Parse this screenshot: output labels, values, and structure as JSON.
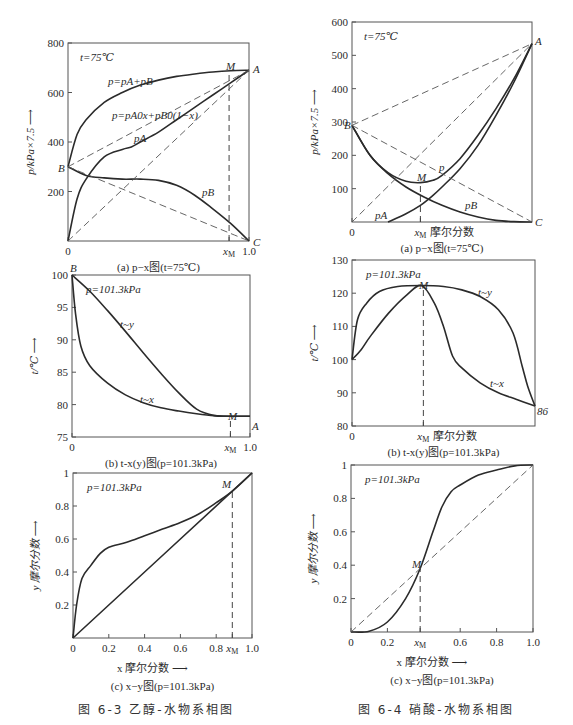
{
  "figures": [
    {
      "id": "6-3",
      "caption": "图 6-3    乙醇-水物系相图"
    },
    {
      "id": "6-4",
      "caption": "图 6-4    硝酸-水物系相图"
    }
  ],
  "chart_data": [
    {
      "id": "6-3a",
      "type": "line",
      "title": "(a) p−x图(t=75℃)",
      "annotation": "t=75℃",
      "xlabel": "",
      "ylabel": "p/kPa×7.5",
      "xlim": [
        0,
        1
      ],
      "ylim": [
        0,
        800
      ],
      "xticks": [
        "0",
        "xM",
        "1.0"
      ],
      "yticks": [
        200,
        400,
        600,
        800
      ],
      "point_labels": [
        "A",
        "B",
        "C",
        "M"
      ],
      "series": [
        {
          "name": "p=pA+pB",
          "x": [
            0,
            0.05,
            0.1,
            0.2,
            0.3,
            0.4,
            0.5,
            0.6,
            0.7,
            0.8,
            0.9,
            1.0
          ],
          "y": [
            300,
            430,
            490,
            560,
            600,
            630,
            650,
            665,
            675,
            683,
            688,
            690
          ]
        },
        {
          "name": "pA",
          "x": [
            0,
            0.05,
            0.1,
            0.2,
            0.3,
            0.35,
            0.4,
            0.5,
            0.6,
            0.7,
            0.8,
            0.9,
            1.0
          ],
          "y": [
            0,
            170,
            250,
            340,
            370,
            380,
            400,
            440,
            490,
            540,
            590,
            640,
            690
          ]
        },
        {
          "name": "pB",
          "x": [
            0,
            0.1,
            0.2,
            0.3,
            0.4,
            0.5,
            0.6,
            0.7,
            0.8,
            0.9,
            1.0
          ],
          "y": [
            300,
            265,
            255,
            250,
            250,
            245,
            225,
            185,
            130,
            70,
            0
          ]
        },
        {
          "name": "p=pA0x+pB0(1−x)",
          "style": "dashed",
          "x": [
            0,
            1
          ],
          "y": [
            300,
            690
          ]
        },
        {
          "name": "ideal pA",
          "style": "dashed",
          "x": [
            0,
            1
          ],
          "y": [
            0,
            690
          ]
        },
        {
          "name": "ideal pB",
          "style": "dashed",
          "x": [
            0,
            1
          ],
          "y": [
            300,
            0
          ]
        }
      ],
      "xM": 0.89
    },
    {
      "id": "6-3b",
      "type": "line",
      "title": "(b) t-x(y)图(p=101.3kPa)",
      "annotation": "p=101.3kPa",
      "ylabel": "t/℃",
      "xlim": [
        0,
        1
      ],
      "ylim": [
        75,
        100
      ],
      "xticks": [
        "0",
        "xM",
        "1.0"
      ],
      "yticks": [
        75,
        80,
        85,
        90,
        95,
        100
      ],
      "point_labels": [
        "B",
        "M",
        "A"
      ],
      "series": [
        {
          "name": "t~y",
          "x": [
            0,
            0.1,
            0.2,
            0.3,
            0.4,
            0.5,
            0.6,
            0.7,
            0.8,
            0.89,
            1.0
          ],
          "y": [
            100,
            97.5,
            94.5,
            91.3,
            88,
            84.8,
            81.8,
            79.3,
            78.3,
            78.2,
            78.2
          ]
        },
        {
          "name": "t~x",
          "x": [
            0,
            0.02,
            0.05,
            0.1,
            0.2,
            0.3,
            0.4,
            0.5,
            0.6,
            0.7,
            0.8,
            0.89,
            1.0
          ],
          "y": [
            100,
            94,
            89,
            86,
            83.3,
            81.5,
            80.3,
            79.5,
            79,
            78.6,
            78.3,
            78.2,
            78.2
          ]
        }
      ],
      "xM": 0.89
    },
    {
      "id": "6-3c",
      "type": "line",
      "title": "(c) x−y图(p=101.3kPa)",
      "annotation": "p=101.3kPa",
      "xlabel": "x 摩尔分数",
      "ylabel": "y 摩尔分数",
      "xlim": [
        0,
        1
      ],
      "ylim": [
        0,
        1
      ],
      "xticks": [
        "0",
        "0.2",
        "0.4",
        "0.6",
        "0.8",
        "xM",
        "1.0"
      ],
      "yticks": [
        0.2,
        0.4,
        0.6,
        0.8,
        1.0
      ],
      "point_labels": [
        "M"
      ],
      "series": [
        {
          "name": "equilibrium",
          "x": [
            0,
            0.02,
            0.05,
            0.1,
            0.15,
            0.2,
            0.3,
            0.4,
            0.5,
            0.6,
            0.7,
            0.8,
            0.89,
            1.0
          ],
          "y": [
            0,
            0.2,
            0.36,
            0.44,
            0.51,
            0.55,
            0.58,
            0.62,
            0.66,
            0.7,
            0.75,
            0.82,
            0.89,
            1.0
          ]
        },
        {
          "name": "diagonal",
          "x": [
            0,
            1
          ],
          "y": [
            0,
            1
          ]
        }
      ],
      "xM": 0.89
    },
    {
      "id": "6-4a",
      "type": "line",
      "title": "(a) p−x图(t=75℃)",
      "annotation": "t=75℃",
      "xlabel": "xM 摩尔分数",
      "ylabel": "p/kPa×7.5",
      "xlim": [
        0,
        1
      ],
      "ylim": [
        0,
        600
      ],
      "xticks": [
        "0",
        "xM"
      ],
      "yticks": [
        100,
        200,
        300,
        400,
        500,
        600
      ],
      "point_labels": [
        "A",
        "B",
        "C",
        "M",
        "p",
        "pA",
        "pB"
      ],
      "series": [
        {
          "name": "p",
          "x": [
            0,
            0.1,
            0.2,
            0.3,
            0.38,
            0.45,
            0.5,
            0.6,
            0.7,
            0.8,
            0.9,
            1.0
          ],
          "y": [
            290,
            200,
            148,
            122,
            118,
            125,
            140,
            190,
            260,
            340,
            430,
            535
          ]
        },
        {
          "name": "pA",
          "x": [
            0.2,
            0.3,
            0.38,
            0.45,
            0.5,
            0.6,
            0.7,
            0.8,
            0.9,
            1.0
          ],
          "y": [
            0,
            25,
            50,
            80,
            105,
            160,
            230,
            320,
            420,
            535
          ]
        },
        {
          "name": "pB",
          "x": [
            0,
            0.1,
            0.2,
            0.3,
            0.4,
            0.5,
            0.6,
            0.7,
            0.8,
            0.9,
            1.0
          ],
          "y": [
            290,
            200,
            145,
            105,
            75,
            50,
            30,
            15,
            5,
            1,
            0
          ]
        },
        {
          "name": "ideal p",
          "style": "dashed",
          "x": [
            0,
            1
          ],
          "y": [
            290,
            535
          ]
        },
        {
          "name": "ideal pA",
          "style": "dashed",
          "x": [
            0,
            1
          ],
          "y": [
            0,
            535
          ]
        },
        {
          "name": "ideal pB",
          "style": "dashed",
          "x": [
            0,
            1
          ],
          "y": [
            290,
            0
          ]
        }
      ],
      "xM": 0.38
    },
    {
      "id": "6-4b",
      "type": "line",
      "title": "(b) t-x(y)图(p=101.3kPa)",
      "annotation": "p=101.3kPa",
      "xlabel": "xM 摩尔分数",
      "ylabel": "t/℃",
      "xlim": [
        0,
        1
      ],
      "ylim": [
        80,
        130
      ],
      "xticks": [
        "0",
        "xM"
      ],
      "yticks": [
        80,
        90,
        100,
        110,
        120,
        130
      ],
      "point_labels": [
        "M",
        "86"
      ],
      "series": [
        {
          "name": "t~y",
          "x": [
            0,
            0.03,
            0.08,
            0.15,
            0.25,
            0.38,
            0.5,
            0.6,
            0.7,
            0.8,
            0.88,
            0.93,
            0.96,
            1.0
          ],
          "y": [
            100,
            112,
            117,
            120.5,
            122,
            122.3,
            122,
            121,
            119,
            115,
            108,
            98,
            92,
            86
          ]
        },
        {
          "name": "t~x",
          "x": [
            0,
            0.05,
            0.1,
            0.2,
            0.3,
            0.38,
            0.45,
            0.5,
            0.55,
            0.6,
            0.7,
            0.8,
            0.9,
            1.0
          ],
          "y": [
            100,
            103,
            107,
            114,
            119.5,
            122.3,
            117,
            110,
            101,
            97.5,
            93,
            90,
            88,
            86
          ]
        }
      ],
      "xM": 0.39
    },
    {
      "id": "6-4c",
      "type": "line",
      "title": "(c) x−y图(p=101.3kPa)",
      "annotation": "p=101.3kPa",
      "xlabel": "x 摩尔分数",
      "ylabel": "y 摩尔分数",
      "xlim": [
        0,
        1
      ],
      "ylim": [
        0,
        1
      ],
      "xticks": [
        "0",
        "0.2",
        "xM",
        "0.6",
        "0.8",
        "1.0"
      ],
      "yticks": [
        0.2,
        0.4,
        0.6,
        0.8,
        1.0
      ],
      "point_labels": [
        "M"
      ],
      "series": [
        {
          "name": "equilibrium",
          "x": [
            0,
            0.1,
            0.2,
            0.3,
            0.38,
            0.45,
            0.5,
            0.55,
            0.6,
            0.7,
            0.8,
            0.9,
            1.0
          ],
          "y": [
            0,
            0.005,
            0.06,
            0.2,
            0.38,
            0.6,
            0.75,
            0.84,
            0.88,
            0.94,
            0.97,
            0.995,
            1.0
          ]
        },
        {
          "name": "diagonal",
          "style": "dashed",
          "x": [
            0,
            1
          ],
          "y": [
            0,
            1
          ]
        }
      ],
      "xM": 0.38
    }
  ]
}
